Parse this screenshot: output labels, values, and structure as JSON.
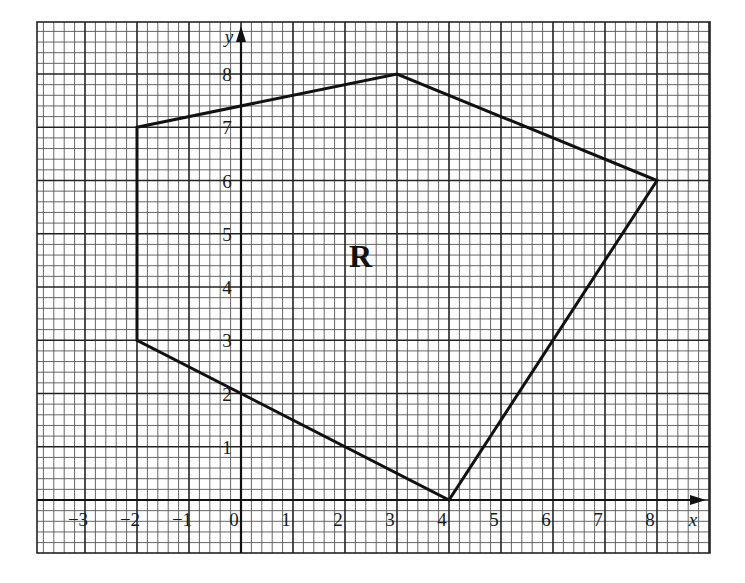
{
  "diagram": {
    "type": "coordinate-grid-polygon",
    "region_label": "R",
    "axes": {
      "x_label": "x",
      "y_label": "y",
      "x_ticks": [
        "−3",
        "−2",
        "−1",
        "0",
        "1",
        "2",
        "3",
        "4",
        "5",
        "6",
        "7",
        "8"
      ],
      "x_tick_values": [
        -3,
        -2,
        -1,
        0,
        1,
        2,
        3,
        4,
        5,
        6,
        7,
        8
      ],
      "y_ticks": [
        "1",
        "2",
        "3",
        "4",
        "5",
        "6",
        "7",
        "8"
      ],
      "y_tick_values": [
        1,
        2,
        3,
        4,
        5,
        6,
        7,
        8
      ],
      "x_range": [
        -3.95,
        8.95
      ],
      "y_range": [
        -1.0,
        9.0
      ],
      "minor_step": 0.2,
      "major_step": 1
    },
    "polygon_vertices": [
      {
        "x": -2,
        "y": 7
      },
      {
        "x": 3,
        "y": 8
      },
      {
        "x": 8,
        "y": 6
      },
      {
        "x": 4,
        "y": 0
      },
      {
        "x": -2,
        "y": 3
      }
    ],
    "region_label_position": {
      "x": 2.3,
      "y": 4.6
    },
    "colors": {
      "line": "#111111",
      "grid_minor": "#555555",
      "grid_major": "#222222",
      "background": "#ffffff"
    }
  }
}
